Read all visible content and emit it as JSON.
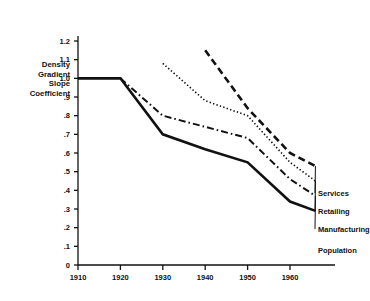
{
  "chart_data": {
    "type": "line",
    "title": "",
    "xlabel": "",
    "ylabel": "Density Gradient Slope Coefficient",
    "ylabel_lines": [
      "Density",
      "Gradient",
      "Slope",
      "Coefficient"
    ],
    "x": [
      1910,
      1920,
      1930,
      1940,
      1950,
      1960,
      1966
    ],
    "xlim": [
      1906,
      1970
    ],
    "ylim": [
      0,
      1.25
    ],
    "xticks": [
      1910,
      1920,
      1930,
      1940,
      1950,
      1960
    ],
    "xtick_labels": [
      "1910",
      "1920",
      "1930",
      "1940",
      "1950",
      "1960"
    ],
    "yticks": [
      0,
      0.1,
      0.2,
      0.3,
      0.4,
      0.5,
      0.6,
      0.7,
      0.8,
      0.9,
      1.0,
      1.1,
      1.2
    ],
    "ytick_labels": [
      "0",
      ".1",
      ".2",
      ".3",
      ".4",
      ".5",
      ".6",
      ".7",
      ".8",
      ".9",
      "1.0",
      "1.1",
      "1.2"
    ],
    "grid": false,
    "legend_position": "right-inline",
    "series": [
      {
        "name": "Services",
        "label": "Services",
        "style": "dashed",
        "color": "#111111",
        "width": 2.6,
        "x": [
          1940,
          1950,
          1960,
          1966
        ],
        "values": [
          1.15,
          0.84,
          0.6,
          0.53
        ]
      },
      {
        "name": "Retailing",
        "label": "Retailing",
        "style": "dotted",
        "color": "#111111",
        "width": 1.6,
        "x": [
          1930,
          1940,
          1950,
          1960,
          1966
        ],
        "values": [
          1.08,
          0.88,
          0.8,
          0.55,
          0.45
        ]
      },
      {
        "name": "Manufacturing",
        "label": "Manufacturing",
        "style": "dashdot",
        "color": "#111111",
        "width": 2.0,
        "x": [
          1920,
          1930,
          1940,
          1950,
          1960,
          1966
        ],
        "values": [
          1.0,
          0.8,
          0.74,
          0.68,
          0.46,
          0.37
        ]
      },
      {
        "name": "Population",
        "label": "Population",
        "style": "solid",
        "color": "#111111",
        "width": 2.6,
        "x": [
          1910,
          1920,
          1930,
          1940,
          1950,
          1960,
          1966
        ],
        "values": [
          1.0,
          1.0,
          0.7,
          0.62,
          0.55,
          0.34,
          0.29
        ]
      }
    ]
  }
}
